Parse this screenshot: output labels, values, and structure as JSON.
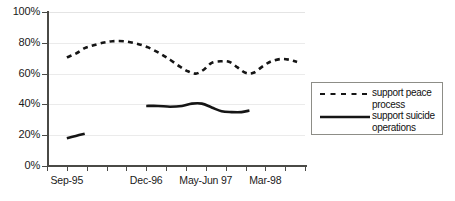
{
  "chart_data": {
    "type": "line",
    "title": "",
    "subtitle": "",
    "xlabel": "",
    "ylabel": "",
    "ylim": [
      0,
      100
    ],
    "ytick_labels": [
      "0%",
      "20%",
      "40%",
      "60%",
      "80%",
      "100%"
    ],
    "ytick_values": [
      0,
      20,
      40,
      60,
      80,
      100
    ],
    "grid": "horizontal",
    "legend_position": "right-outside",
    "x_tick_count": 13,
    "xtick_labels": [
      {
        "label": "Sep-95",
        "index": 1
      },
      {
        "label": "Dec-96",
        "index": 5
      },
      {
        "label": "May-Jun 97",
        "index": 8
      },
      {
        "label": "Mar-98",
        "index": 11
      }
    ],
    "series": [
      {
        "name": "support peace process",
        "style": "dashed",
        "color": "#151515",
        "points": [
          {
            "x": 1.0,
            "y": 70.5
          },
          {
            "x": 1.45,
            "y": 73.0
          },
          {
            "x": 1.9,
            "y": 76.5
          },
          {
            "x": 2.25,
            "y": 78.0
          },
          {
            "x": 2.8,
            "y": 80.0
          },
          {
            "x": 3.3,
            "y": 81.0
          },
          {
            "x": 3.9,
            "y": 81.0
          },
          {
            "x": 4.5,
            "y": 79.5
          },
          {
            "x": 5.1,
            "y": 77.0
          },
          {
            "x": 5.7,
            "y": 73.0
          },
          {
            "x": 6.2,
            "y": 69.0
          },
          {
            "x": 6.7,
            "y": 64.5
          },
          {
            "x": 7.1,
            "y": 61.5
          },
          {
            "x": 7.5,
            "y": 60.0
          },
          {
            "x": 7.9,
            "y": 62.5
          },
          {
            "x": 8.3,
            "y": 67.0
          },
          {
            "x": 8.8,
            "y": 68.0
          },
          {
            "x": 9.2,
            "y": 67.5
          },
          {
            "x": 9.6,
            "y": 64.0
          },
          {
            "x": 10.0,
            "y": 60.5
          },
          {
            "x": 10.4,
            "y": 60.5
          },
          {
            "x": 10.9,
            "y": 65.0
          },
          {
            "x": 11.3,
            "y": 68.0
          },
          {
            "x": 11.8,
            "y": 69.5
          },
          {
            "x": 12.2,
            "y": 69.0
          },
          {
            "x": 12.6,
            "y": 67.5
          }
        ]
      },
      {
        "name": "support suicide operations",
        "style": "solid",
        "color": "#151515",
        "segments": [
          {
            "points": [
              {
                "x": 1.0,
                "y": 18.0
              },
              {
                "x": 1.45,
                "y": 19.5
              },
              {
                "x": 1.9,
                "y": 21.0
              }
            ]
          },
          {
            "points": [
              {
                "x": 5.0,
                "y": 39.0
              },
              {
                "x": 5.6,
                "y": 39.0
              },
              {
                "x": 6.2,
                "y": 38.5
              },
              {
                "x": 6.8,
                "y": 39.0
              },
              {
                "x": 7.3,
                "y": 40.5
              },
              {
                "x": 7.8,
                "y": 40.5
              },
              {
                "x": 8.3,
                "y": 38.0
              },
              {
                "x": 8.8,
                "y": 35.5
              },
              {
                "x": 9.3,
                "y": 35.0
              },
              {
                "x": 9.8,
                "y": 35.0
              },
              {
                "x": 10.2,
                "y": 36.0
              }
            ]
          }
        ]
      }
    ]
  },
  "legend": {
    "items": [
      {
        "label": "support peace process",
        "style": "dashed"
      },
      {
        "label": "support suicide operations",
        "style": "solid"
      }
    ]
  }
}
